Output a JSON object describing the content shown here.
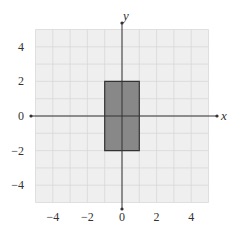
{
  "chart_data": {
    "type": "area",
    "title": "",
    "xlabel": "x",
    "ylabel": "y",
    "xlim": [
      -5,
      5
    ],
    "ylim": [
      -5,
      5
    ],
    "grid": true,
    "grid_step": 1,
    "x_ticks": [
      -4,
      -2,
      0,
      2,
      4
    ],
    "y_ticks": [
      -4,
      -2,
      0,
      2,
      4
    ],
    "x_tick_labels": [
      "−4",
      "−2",
      "0",
      "2",
      "4"
    ],
    "y_tick_labels": [
      "−4",
      "−2",
      "0",
      "2",
      "4"
    ],
    "shapes": [
      {
        "kind": "rectangle",
        "vertices": [
          [
            -1,
            -2
          ],
          [
            1,
            -2
          ],
          [
            1,
            2
          ],
          [
            -1,
            2
          ]
        ],
        "fill": "#888888",
        "stroke": "#333333"
      }
    ]
  },
  "colors": {
    "grid_bg": "#efefef",
    "grid_line": "#d8d8d8",
    "axis": "#333333",
    "shape_fill": "#888888"
  }
}
